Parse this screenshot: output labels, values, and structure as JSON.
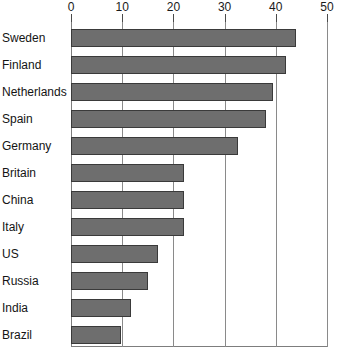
{
  "chart_data": {
    "type": "bar",
    "orientation": "horizontal",
    "title": "",
    "xlabel": "",
    "ylabel": "",
    "xlim": [
      0,
      50
    ],
    "xticks": [
      0,
      10,
      20,
      30,
      40,
      50
    ],
    "xtick_labels": [
      "0",
      "10",
      "20",
      "30",
      "40",
      "50"
    ],
    "grid": true,
    "grid_axis": "x",
    "legend": false,
    "bar_color": "#6e6e6e",
    "bar_edge_color": "#3a3a3a",
    "categories": [
      "Sweden",
      "Finland",
      "Netherlands",
      "Spain",
      "Germany",
      "Britain",
      "China",
      "Italy",
      "US",
      "Russia",
      "India",
      "Brazil"
    ],
    "values": [
      44,
      42,
      39.5,
      38,
      32.6,
      22,
      22,
      22,
      17,
      15,
      11.7,
      9.8
    ]
  }
}
